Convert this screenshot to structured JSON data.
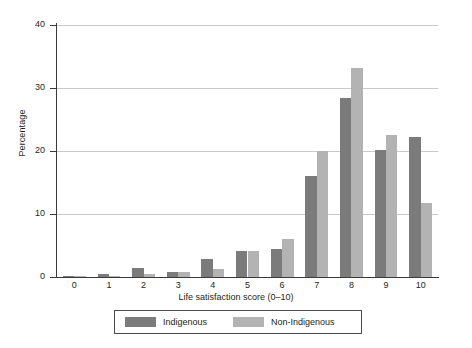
{
  "chart_data": {
    "type": "bar",
    "title": "",
    "xlabel": "Life satisfaction score (0–10)",
    "ylabel": "Percentage",
    "categories": [
      "0",
      "1",
      "2",
      "3",
      "4",
      "5",
      "6",
      "7",
      "8",
      "9",
      "10"
    ],
    "series": [
      {
        "name": "Indigenous",
        "color": "#7b7b7b",
        "values": [
          0.1,
          0.4,
          1.5,
          0.8,
          2.8,
          4.2,
          4.4,
          16.0,
          28.4,
          20.1,
          22.2
        ]
      },
      {
        "name": "Non-Indigenous",
        "color": "#b3b3b3",
        "values": [
          0.1,
          0.2,
          0.4,
          0.8,
          1.3,
          4.2,
          6.1,
          20.0,
          33.2,
          22.5,
          11.7
        ]
      }
    ],
    "ylim": [
      0,
      40
    ],
    "yticks": [
      0,
      10,
      20,
      30,
      40
    ],
    "ytick_labels": [
      "0",
      "10",
      "20",
      "30",
      "40"
    ],
    "grid": "horizontal",
    "legend_position": "bottom-center",
    "legend_entries": [
      "Indigenous",
      "Non-Indigenous"
    ]
  }
}
